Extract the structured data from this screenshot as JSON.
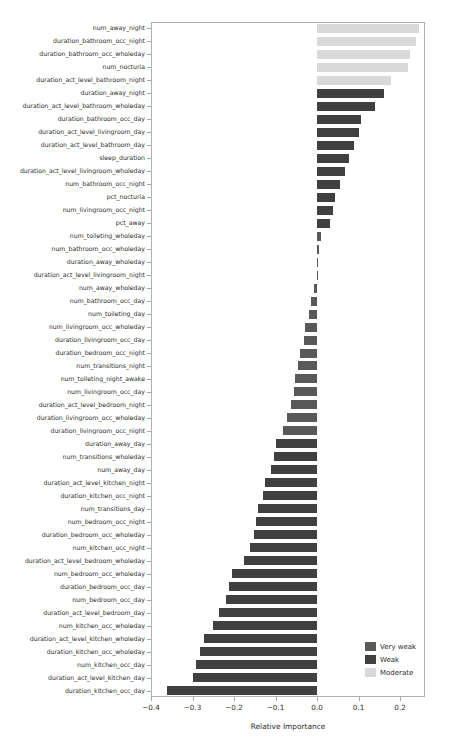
{
  "chart_data": {
    "type": "bar",
    "orientation": "horizontal",
    "title": "",
    "xlabel": "Relative Importance",
    "ylabel": "",
    "xlim": [
      -0.4,
      0.26
    ],
    "xticks": [
      -0.4,
      -0.3,
      -0.2,
      -0.1,
      0.0,
      0.1,
      0.2
    ],
    "xticklabels": [
      "−0.4",
      "−0.3",
      "−0.2",
      "−0.1",
      "0.0",
      "0.1",
      "0.2"
    ],
    "grid": false,
    "legend_position": "lower right",
    "categories": [
      "num_away_night",
      "duration_bathroom_occ_night",
      "duration_bathroom_occ_wholeday",
      "num_nocturia",
      "duration_act_level_bathroom_night",
      "duration_away_night",
      "duration_act_level_bathroom_wholeday",
      "duration_bathroom_occ_day",
      "duration_act_level_livingroom_day",
      "duration_act_level_bathroom_day",
      "sleep_duration",
      "duration_act_level_livingroom_wholeday",
      "num_bathroom_occ_night",
      "pct_nocturia",
      "num_livingroom_occ_night",
      "pct_away",
      "num_toileting_wholeday",
      "num_bathroom_occ_wholeday",
      "duration_away_wholeday",
      "duration_act_level_livingroom_night",
      "num_away_wholeday",
      "num_bathroom_occ_day",
      "num_toileting_day",
      "num_livingroom_occ_wholeday",
      "duration_livingroom_occ_day",
      "duration_bedroom_occ_night",
      "num_transitions_night",
      "num_toileting_night_awake",
      "num_livingroom_occ_day",
      "duration_act_level_bedroom_night",
      "duration_livingroom_occ_wholeday",
      "duration_livingroom_occ_night",
      "duration_away_day",
      "num_transitions_wholeday",
      "num_away_day",
      "duration_act_level_kitchen_night",
      "duration_kitchen_occ_night",
      "num_transitions_day",
      "num_bedroom_occ_night",
      "duration_bedroom_occ_wholeday",
      "num_kitchen_occ_night",
      "duration_act_level_bedroom_wholeday",
      "num_bedroom_occ_wholeday",
      "duration_bedroom_occ_day",
      "num_bedroom_occ_day",
      "duration_act_level_bedroom_day",
      "num_kitchen_occ_wholeday",
      "duration_act_level_kitchen_wholeday",
      "duration_kitchen_occ_wholeday",
      "num_kitchen_occ_day",
      "duration_act_level_kitchen_day",
      "duration_kitchen_occ_day"
    ],
    "values": [
      0.246,
      0.239,
      0.224,
      0.219,
      0.178,
      0.162,
      0.139,
      0.107,
      0.1,
      0.09,
      0.078,
      0.068,
      0.055,
      0.044,
      0.039,
      0.031,
      0.009,
      0.005,
      0.003,
      0.002,
      -0.007,
      -0.015,
      -0.019,
      -0.029,
      -0.031,
      -0.041,
      -0.046,
      -0.053,
      -0.055,
      -0.063,
      -0.073,
      -0.081,
      -0.1,
      -0.104,
      -0.11,
      -0.125,
      -0.131,
      -0.142,
      -0.148,
      -0.153,
      -0.161,
      -0.175,
      -0.204,
      -0.212,
      -0.22,
      -0.236,
      -0.251,
      -0.272,
      -0.283,
      -0.292,
      -0.3,
      -0.362
    ],
    "strengths": [
      "Moderate",
      "Moderate",
      "Moderate",
      "Moderate",
      "Moderate",
      "Weak",
      "Weak",
      "Weak",
      "Weak",
      "Weak",
      "Weak",
      "Weak",
      "Weak",
      "Weak",
      "Weak",
      "Weak",
      "Very weak",
      "Very weak",
      "Very weak",
      "Very weak",
      "Very weak",
      "Very weak",
      "Very weak",
      "Very weak",
      "Very weak",
      "Very weak",
      "Very weak",
      "Very weak",
      "Very weak",
      "Very weak",
      "Very weak",
      "Very weak",
      "Weak",
      "Weak",
      "Weak",
      "Weak",
      "Weak",
      "Weak",
      "Weak",
      "Weak",
      "Weak",
      "Weak",
      "Weak",
      "Weak",
      "Weak",
      "Weak",
      "Weak",
      "Weak",
      "Weak",
      "Weak",
      "Weak",
      "Weak"
    ],
    "legend": [
      {
        "label": "Very weak",
        "color": "#595959"
      },
      {
        "label": "Weak",
        "color": "#404040"
      },
      {
        "label": "Moderate",
        "color": "#d9d9d9"
      }
    ],
    "colors": {
      "very_weak": "#595959",
      "weak": "#404040",
      "moderate": "#d9d9d9",
      "axis": "#b0b0b0",
      "text": "#2b2b2b",
      "background": "#ffffff"
    }
  }
}
